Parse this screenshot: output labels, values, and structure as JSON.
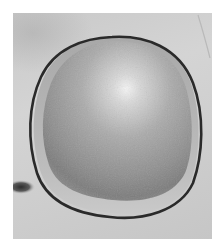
{
  "image": {
    "description": "Grayscale clinical photograph of a rounded dome-shaped skin lesion outlined with a dark marker line",
    "colors": {
      "background": "#ffffff",
      "skin": "#cecece",
      "lesion_base": "#9e9e9e",
      "lesion_highlight": "#f2f2f2",
      "lesion_shadow": "#7a7a7a",
      "outline": "#2a2a2a",
      "dark_spot": "#3a3a3a"
    }
  }
}
